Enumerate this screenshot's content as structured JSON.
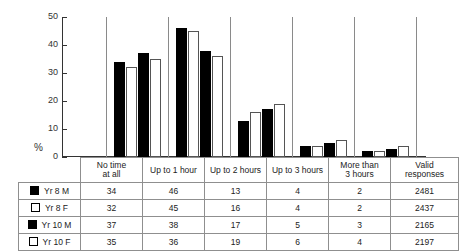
{
  "chart_data": {
    "type": "bar",
    "title": "",
    "subtitle": "",
    "xlabel": "",
    "ylabel": "%",
    "ylim": [
      0,
      50
    ],
    "yticks": [
      0,
      10,
      20,
      30,
      40,
      50
    ],
    "grid": false,
    "legend_position": "table-left",
    "categories": [
      "No time at all",
      "Up to 1 hour",
      "Up to 2 hours",
      "Up to 3 hours",
      "More than 3 hours"
    ],
    "series": [
      {
        "name": "Yr 8 M",
        "style": "filled",
        "values": [
          34,
          46,
          13,
          4,
          2
        ]
      },
      {
        "name": "Yr 8 F",
        "style": "open",
        "values": [
          32,
          45,
          16,
          4,
          2
        ]
      },
      {
        "name": "Yr 10 M",
        "style": "filled",
        "values": [
          37,
          38,
          17,
          5,
          3
        ]
      },
      {
        "name": "Yr 10 F",
        "style": "open",
        "values": [
          35,
          36,
          19,
          6,
          4
        ]
      }
    ],
    "extra_column": {
      "name": "Valid responses",
      "values": [
        2481,
        2437,
        2165,
        2197
      ]
    }
  },
  "axis": {
    "y_label": "%",
    "ticks": [
      "50",
      "40",
      "30",
      "20",
      "10",
      "0"
    ]
  },
  "table": {
    "legend_header": "",
    "column_headers": [
      {
        "line1": "No time",
        "line2": "at all"
      },
      {
        "line1": "Up to 1 hour",
        "line2": ""
      },
      {
        "line1": "Up to 2 hours",
        "line2": ""
      },
      {
        "line1": "Up to 3 hours",
        "line2": ""
      },
      {
        "line1": "More than",
        "line2": "3 hours"
      },
      {
        "line1": "Valid",
        "line2": "responses"
      }
    ],
    "rows": [
      {
        "label": "Yr 8 M",
        "swatch": "filled",
        "cells": [
          "34",
          "46",
          "13",
          "4",
          "2",
          "2481"
        ]
      },
      {
        "label": "Yr 8 F",
        "swatch": "open",
        "cells": [
          "32",
          "45",
          "16",
          "4",
          "2",
          "2437"
        ]
      },
      {
        "label": "Yr 10 M",
        "swatch": "filled",
        "cells": [
          "37",
          "38",
          "17",
          "5",
          "3",
          "2165"
        ]
      },
      {
        "label": "Yr 10 F",
        "swatch": "open",
        "cells": [
          "35",
          "36",
          "19",
          "6",
          "4",
          "2197"
        ]
      }
    ]
  },
  "colors": {
    "filled": "#000000",
    "open": "#ffffff",
    "open_border": "#555555",
    "axis": "#333333",
    "grid_border": "#8f8f8f"
  }
}
